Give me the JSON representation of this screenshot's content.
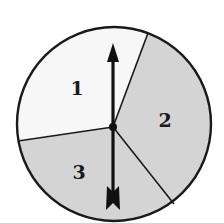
{
  "diagram": {
    "type": "spinner",
    "sections": [
      {
        "label": "1",
        "color": "#f7f7f7"
      },
      {
        "label": "2",
        "color": "#d4d4d4"
      },
      {
        "label": "3",
        "color": "#d4d4d4"
      }
    ],
    "outline_color": "#1a1a1a",
    "arrow_color": "#111111"
  }
}
